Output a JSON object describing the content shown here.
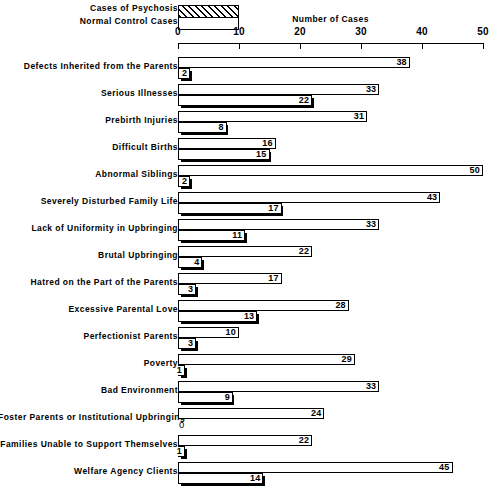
{
  "chart_data": {
    "type": "bar",
    "orientation": "horizontal",
    "title": "",
    "xlabel": "Number of Cases",
    "ylabel": "",
    "xlim": [
      0,
      50
    ],
    "xticks": [
      0,
      10,
      20,
      30,
      40,
      50
    ],
    "grid": false,
    "legend_position": "top",
    "legend": [
      {
        "label": "Cases of Psychosis",
        "fill": "hatched"
      },
      {
        "label": "Normal Control Cases",
        "fill": "white"
      }
    ],
    "series": [
      {
        "name": "Cases of Psychosis",
        "fill": "hatched",
        "values": [
          38,
          33,
          31,
          16,
          50,
          43,
          33,
          22,
          17,
          28,
          10,
          29,
          33,
          24,
          22,
          45
        ]
      },
      {
        "name": "Normal Control Cases",
        "fill": "white",
        "values": [
          2,
          22,
          8,
          15,
          2,
          17,
          11,
          4,
          3,
          13,
          3,
          1,
          9,
          0,
          1,
          14
        ]
      }
    ],
    "categories": [
      "Defects Inherited from the Parents",
      "Serious Illnesses",
      "Prebirth Injuries",
      "Difficult Births",
      "Abnormal Siblings",
      "Severely Disturbed Family Life",
      "Lack of Uniformity in Upbringing",
      "Brutal Upbringing",
      "Hatred on the Part of the Parents",
      "Excessive Parental Love",
      "Perfectionist Parents",
      "Poverty",
      "Bad Environment",
      "Foster Parents or Institutional Upbringing",
      "Families Unable to Support Themselves",
      "Welfare Agency Clients"
    ],
    "rows": [
      {
        "category": "Defects Inherited from the Parents",
        "psychosis": 38,
        "control": 2
      },
      {
        "category": "Serious Illnesses",
        "psychosis": 33,
        "control": 22
      },
      {
        "category": "Prebirth Injuries",
        "psychosis": 31,
        "control": 8
      },
      {
        "category": "Difficult Births",
        "psychosis": 16,
        "control": 15
      },
      {
        "category": "Abnormal Siblings",
        "psychosis": 50,
        "control": 2
      },
      {
        "category": "Severely Disturbed Family Life",
        "psychosis": 43,
        "control": 17
      },
      {
        "category": "Lack of Uniformity in Upbringing",
        "psychosis": 33,
        "control": 11
      },
      {
        "category": "Brutal Upbringing",
        "psychosis": 22,
        "control": 4
      },
      {
        "category": "Hatred on the Part of the Parents",
        "psychosis": 17,
        "control": 3
      },
      {
        "category": "Excessive Parental Love",
        "psychosis": 28,
        "control": 13
      },
      {
        "category": "Perfectionist Parents",
        "psychosis": 10,
        "control": 3
      },
      {
        "category": "Poverty",
        "psychosis": 29,
        "control": 1
      },
      {
        "category": "Bad Environment",
        "psychosis": 33,
        "control": 9
      },
      {
        "category": "Foster Parents or Institutional Upbringing",
        "psychosis": 24,
        "control": 0
      },
      {
        "category": "Families Unable to Support Themselves",
        "psychosis": 22,
        "control": 1
      },
      {
        "category": "Welfare Agency Clients",
        "psychosis": 45,
        "control": 14
      }
    ]
  },
  "colors": {
    "ink": "#000000",
    "paper": "#ffffff"
  }
}
